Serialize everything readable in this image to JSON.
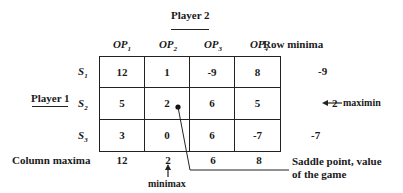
{
  "player2": {
    "label": "Player 2"
  },
  "player1": {
    "label": "Player 1"
  },
  "columns": [
    {
      "base": "OP",
      "sub": "1"
    },
    {
      "base": "OP",
      "sub": "2"
    },
    {
      "base": "OP",
      "sub": "3"
    },
    {
      "base": "OP",
      "sub": "4"
    }
  ],
  "row_minima_header": "Row minima",
  "rows": [
    {
      "base": "S",
      "sub": "1",
      "values": [
        "12",
        "1",
        "-9",
        "8"
      ],
      "row_min": "-9"
    },
    {
      "base": "S",
      "sub": "2",
      "values": [
        "5",
        "2",
        "6",
        "5"
      ],
      "row_min": "2"
    },
    {
      "base": "S",
      "sub": "3",
      "values": [
        "3",
        "0",
        "6",
        "-7"
      ],
      "row_min": "-7"
    }
  ],
  "column_maxima": {
    "label": "Column maxima",
    "values": [
      "12",
      "2",
      "6",
      "8"
    ]
  },
  "annotations": {
    "maximin": "maximin",
    "minimax": "minimax",
    "saddle_line1": "Saddle point, value",
    "saddle_line2": "of the game"
  }
}
